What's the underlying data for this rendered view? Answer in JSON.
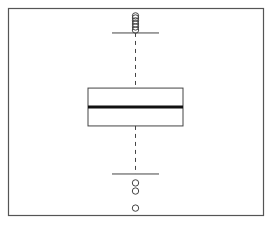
{
  "chart_data": {
    "type": "boxplot",
    "title": "",
    "xlabel": "",
    "ylabel": "",
    "grid": false,
    "legend": null,
    "axis_ticks_visible": false,
    "value_scale_note": "normalized 0-100 (bottom to top of plot area); no axis labels visible",
    "ylim": [
      0,
      100
    ],
    "series": [
      {
        "name": "",
        "q1": 43.3,
        "median": 52.4,
        "q3": 61.5,
        "whisker_low": 20.2,
        "whisker_high": 88.0,
        "outliers_high": [
          89.4,
          90.9,
          92.3,
          93.8,
          95.2,
          96.2
        ],
        "outliers_low": [
          15.9,
          12.0,
          3.8
        ]
      }
    ]
  },
  "style": {
    "frame_color": "#555555",
    "box_color": "#444444",
    "median_color": "#111111",
    "whisker_color": "#444444",
    "outlier_color": "#444444",
    "background": "#ffffff"
  }
}
